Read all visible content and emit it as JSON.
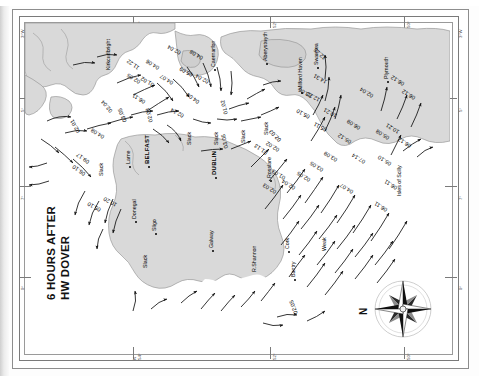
{
  "page": {
    "title_line1": "6 HOURS AFTER",
    "title_line2": "HW DOVER",
    "compass_label": "N"
  },
  "graticule": {
    "longitude_left": [
      "3°W",
      "5°",
      "7°",
      "9°"
    ],
    "longitude_right": [
      "3°W",
      "5°",
      "7°",
      "9°"
    ],
    "latitude_top": [
      "N",
      "54°",
      "52°",
      "50°"
    ],
    "latitude_bottom": [
      "N",
      "54°",
      "52°",
      "50°"
    ]
  },
  "places": [
    {
      "name": "Kirkcudbright",
      "x": 80,
      "y": 47,
      "major": false,
      "dot": false
    },
    {
      "name": "Caernarfon",
      "x": 185,
      "y": 44,
      "major": false,
      "dot": true
    },
    {
      "name": "Aberystwyth",
      "x": 237,
      "y": 38,
      "major": false,
      "dot": true
    },
    {
      "name": "Swansea",
      "x": 288,
      "y": 42,
      "major": false,
      "dot": true
    },
    {
      "name": "Milford Haven",
      "x": 272,
      "y": 67,
      "major": false,
      "dot": true
    },
    {
      "name": "Plymouth",
      "x": 358,
      "y": 56,
      "major": false,
      "dot": true
    },
    {
      "name": "Larne",
      "x": 100,
      "y": 141,
      "major": false,
      "dot": true
    },
    {
      "name": "BELFAST",
      "x": 119,
      "y": 141,
      "major": true,
      "dot": true
    },
    {
      "name": "DUBLIN",
      "x": 186,
      "y": 152,
      "major": true,
      "dot": true
    },
    {
      "name": "Rosslare",
      "x": 241,
      "y": 155,
      "major": false,
      "dot": true
    },
    {
      "name": "Cork",
      "x": 259,
      "y": 226,
      "major": false,
      "dot": true
    },
    {
      "name": "Bantry",
      "x": 265,
      "y": 254,
      "major": false,
      "dot": true
    },
    {
      "name": "R.Shannon",
      "x": 226,
      "y": 249,
      "major": false,
      "dot": false
    },
    {
      "name": "Galway",
      "x": 183,
      "y": 225,
      "major": false,
      "dot": true
    },
    {
      "name": "Sligo",
      "x": 126,
      "y": 208,
      "major": false,
      "dot": true
    },
    {
      "name": "Donegal",
      "x": 106,
      "y": 196,
      "major": false,
      "dot": true
    },
    {
      "name": "Isles of Scilly",
      "x": 371,
      "y": 173,
      "major": false,
      "dot": false
    }
  ],
  "slack_labels": [
    {
      "text": "Slack",
      "x": 161,
      "y": 122
    },
    {
      "text": "Slack",
      "x": 188,
      "y": 122
    },
    {
      "text": "Slack",
      "x": 215,
      "y": 120
    },
    {
      "text": "Slack",
      "x": 238,
      "y": 112
    },
    {
      "text": "Slack",
      "x": 73,
      "y": 153
    },
    {
      "text": "Slack",
      "x": 117,
      "y": 245
    },
    {
      "text": "Weak",
      "x": 296,
      "y": 228
    }
  ],
  "rate_labels": [
    {
      "value": "11.22",
      "x": 112,
      "y": 48,
      "rot": -55
    },
    {
      "value": "04.06",
      "x": 132,
      "y": 48,
      "rot": -58
    },
    {
      "value": "02.05",
      "x": 113,
      "y": 62,
      "rot": -58
    },
    {
      "value": "01.02",
      "x": 127,
      "y": 65,
      "rot": -60
    },
    {
      "value": "04.07",
      "x": 146,
      "y": 63,
      "rot": -58
    },
    {
      "value": "06.11",
      "x": 118,
      "y": 82,
      "rot": -58
    },
    {
      "value": "02.04",
      "x": 154,
      "y": 33,
      "rot": -62
    },
    {
      "value": "04.08",
      "x": 176,
      "y": 38,
      "rot": -60
    },
    {
      "value": "05.09",
      "x": 166,
      "y": 55,
      "rot": -62
    },
    {
      "value": "02.04",
      "x": 182,
      "y": 62,
      "rot": -62
    },
    {
      "value": "04.08",
      "x": 172,
      "y": 82,
      "rot": -55
    },
    {
      "value": "02.14",
      "x": 157,
      "y": 96,
      "rot": -62
    },
    {
      "value": "01.02",
      "x": 198,
      "y": 92,
      "rot": -15
    },
    {
      "value": "02.04",
      "x": 84,
      "y": 91,
      "rot": -40
    },
    {
      "value": "03.05",
      "x": 97,
      "y": 100,
      "rot": -22
    },
    {
      "value": "02.03",
      "x": 123,
      "y": 100,
      "rot": -15
    },
    {
      "value": "02.01",
      "x": 51,
      "y": 111,
      "rot": -30
    },
    {
      "value": "04.08",
      "x": 77,
      "y": 117,
      "rot": -58
    },
    {
      "value": "09.17",
      "x": 62,
      "y": 142,
      "rot": -55
    },
    {
      "value": "06.10",
      "x": 58,
      "y": 154,
      "rot": -55
    },
    {
      "value": "05.10",
      "x": 74,
      "y": 190,
      "rot": -62
    },
    {
      "value": "10.20",
      "x": 90,
      "y": 185,
      "rot": -62
    },
    {
      "value": "03.05",
      "x": 198,
      "y": 126,
      "rot": -12
    },
    {
      "value": "01.13",
      "x": 240,
      "y": 133,
      "rot": -55
    },
    {
      "value": "02.02",
      "x": 252,
      "y": 130,
      "rot": -58
    },
    {
      "value": "02.03",
      "x": 253,
      "y": 120,
      "rot": -45
    },
    {
      "value": "01.03",
      "x": 258,
      "y": 158,
      "rot": -58
    },
    {
      "value": "02.03",
      "x": 249,
      "y": 172,
      "rot": -58
    },
    {
      "value": "02.04",
      "x": 268,
      "y": 168,
      "rot": -58
    },
    {
      "value": "02.05",
      "x": 283,
      "y": 160,
      "rot": -58
    },
    {
      "value": "03.05",
      "x": 296,
      "y": 150,
      "rot": -58
    },
    {
      "value": "02.05",
      "x": 268,
      "y": 292,
      "rot": -20
    },
    {
      "value": "05.10",
      "x": 283,
      "y": 97,
      "rot": -62
    },
    {
      "value": "05.11",
      "x": 300,
      "y": 110,
      "rot": -62
    },
    {
      "value": "10.21",
      "x": 310,
      "y": 96,
      "rot": -62
    },
    {
      "value": "12.22",
      "x": 293,
      "y": 80,
      "rot": -62
    },
    {
      "value": "14.31",
      "x": 300,
      "y": 62,
      "rot": -62
    },
    {
      "value": "12.25",
      "x": 298,
      "y": 38,
      "rot": -48
    },
    {
      "value": "03.06",
      "x": 285,
      "y": 76,
      "rot": -62
    },
    {
      "value": "05.12",
      "x": 324,
      "y": 122,
      "rot": -58
    },
    {
      "value": "06.09",
      "x": 333,
      "y": 108,
      "rot": -58
    },
    {
      "value": "07.14",
      "x": 338,
      "y": 142,
      "rot": -58
    },
    {
      "value": "04.07",
      "x": 326,
      "y": 172,
      "rot": -58
    },
    {
      "value": "03.09",
      "x": 310,
      "y": 140,
      "rot": -58
    },
    {
      "value": "06.11",
      "x": 360,
      "y": 190,
      "rot": -58
    },
    {
      "value": "06.11",
      "x": 370,
      "y": 168,
      "rot": -58
    },
    {
      "value": "05.10",
      "x": 364,
      "y": 144,
      "rot": -58
    },
    {
      "value": "10.21",
      "x": 372,
      "y": 112,
      "rot": -58
    },
    {
      "value": "05.08",
      "x": 362,
      "y": 118,
      "rot": -58
    },
    {
      "value": "02.04",
      "x": 346,
      "y": 76,
      "rot": -58
    },
    {
      "value": "06.12",
      "x": 377,
      "y": 64,
      "rot": -58
    },
    {
      "value": "06.12",
      "x": 388,
      "y": 78,
      "rot": -58
    },
    {
      "value": "06.12",
      "x": 384,
      "y": 126,
      "rot": -58
    }
  ]
}
